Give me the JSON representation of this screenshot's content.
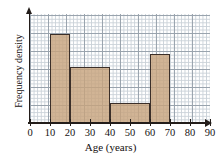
{
  "chart_data": {
    "type": "bar",
    "title": "",
    "subtitle": "",
    "xlabel": "Age (years)",
    "ylabel": "Frequency density",
    "grid": true,
    "legend": "none",
    "xlim": [
      0,
      90
    ],
    "xticks": [
      "0",
      "10",
      "20",
      "30",
      "40",
      "50",
      "60",
      "70",
      "80",
      "90"
    ],
    "yticks": [],
    "ylim": [
      0,
      6
    ],
    "bin_edges": [
      10,
      20,
      40,
      60,
      70
    ],
    "bars": [
      {
        "label": "10-20",
        "x0": 10,
        "x1": 20,
        "height": 4.9
      },
      {
        "label": "20-40",
        "x0": 20,
        "x1": 40,
        "height": 3.1
      },
      {
        "label": "40-60",
        "x0": 40,
        "x1": 60,
        "height": 1.1
      },
      {
        "label": "60-70",
        "x0": 60,
        "x1": 70,
        "height": 3.8
      }
    ],
    "colors": {
      "bar_fill": "#c7a37d",
      "bar_outline": "#3b2f29",
      "grid_minor": "#b9c3cc",
      "grid_major": "#8d98a3",
      "axis": "#231d1a",
      "text": "#161110",
      "background": "#ffffff"
    }
  }
}
